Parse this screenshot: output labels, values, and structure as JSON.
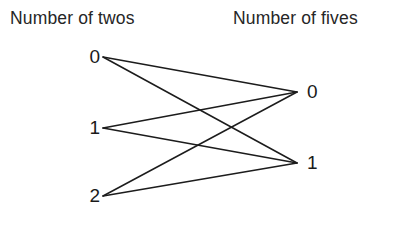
{
  "headings": {
    "left": "Number of twos",
    "right": "Number of fives"
  },
  "left_nodes": [
    {
      "label": "0",
      "value": 0,
      "x": 103,
      "y": 57,
      "label_x": 78,
      "label_y": 46
    },
    {
      "label": "1",
      "value": 1,
      "x": 103,
      "y": 128,
      "label_x": 78,
      "label_y": 117
    },
    {
      "label": "2",
      "value": 2,
      "x": 103,
      "y": 196,
      "label_x": 78,
      "label_y": 185
    }
  ],
  "right_nodes": [
    {
      "label": "0",
      "value": 0,
      "x": 297,
      "y": 92,
      "label_x": 307,
      "label_y": 81
    },
    {
      "label": "1",
      "value": 1,
      "x": 297,
      "y": 163,
      "label_x": 307,
      "label_y": 152
    }
  ],
  "edges": [
    {
      "from": "0",
      "to": "0",
      "x1": 103,
      "y1": 57,
      "x2": 297,
      "y2": 92
    },
    {
      "from": "0",
      "to": "1",
      "x1": 103,
      "y1": 57,
      "x2": 297,
      "y2": 163
    },
    {
      "from": "1",
      "to": "0",
      "x1": 103,
      "y1": 128,
      "x2": 297,
      "y2": 92
    },
    {
      "from": "1",
      "to": "1",
      "x1": 103,
      "y1": 128,
      "x2": 297,
      "y2": 163
    },
    {
      "from": "2",
      "to": "0",
      "x1": 103,
      "y1": 196,
      "x2": 297,
      "y2": 92
    },
    {
      "from": "2",
      "to": "1",
      "x1": 103,
      "y1": 196,
      "x2": 297,
      "y2": 163
    }
  ],
  "style": {
    "background": "#ffffff",
    "edge_color": "#1c1c1c",
    "text_color": "#1a1a1a",
    "heading_color": "#262626"
  }
}
